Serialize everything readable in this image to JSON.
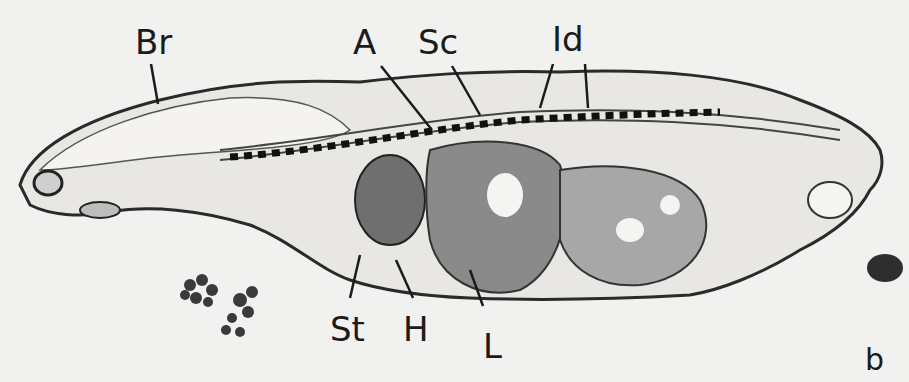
{
  "figure": {
    "panel_label": "b",
    "labels": {
      "brain": "Br",
      "aorta": "A",
      "spinal_cord": "Sc",
      "intervertebral_disc": "Id",
      "stomach": "St",
      "heart": "H",
      "liver": "L"
    }
  }
}
